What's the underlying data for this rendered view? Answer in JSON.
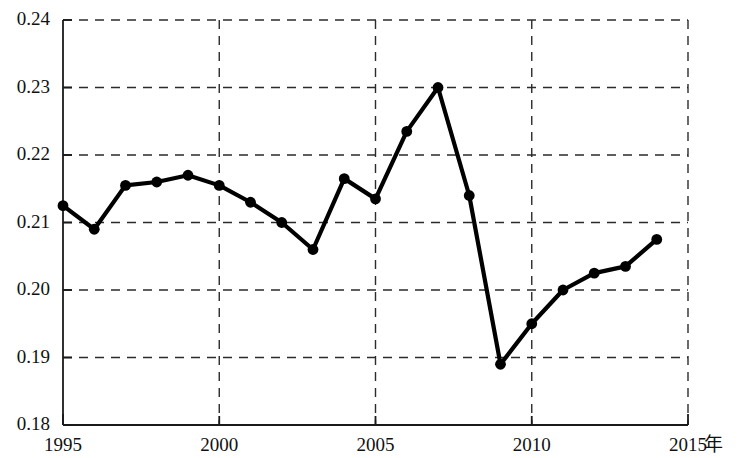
{
  "chart_data": {
    "type": "line",
    "title": "",
    "subtitle": "",
    "xlabel": "年",
    "ylabel": "",
    "xlim": [
      1995,
      2015
    ],
    "ylim": [
      0.18,
      0.24
    ],
    "grid": true,
    "legend": null,
    "x_tick_labels": [
      "1995",
      "2000",
      "2005",
      "2010",
      "2015"
    ],
    "x_ticks": [
      1995,
      2000,
      2005,
      2010,
      2015
    ],
    "y_tick_labels": [
      "0.18",
      "0.19",
      "0.20",
      "0.21",
      "0.22",
      "0.23",
      "0.24"
    ],
    "y_ticks": [
      0.18,
      0.19,
      0.2,
      0.21,
      0.22,
      0.23,
      0.24
    ],
    "x": [
      1995,
      1996,
      1997,
      1998,
      1999,
      2000,
      2001,
      2002,
      2003,
      2004,
      2005,
      2006,
      2007,
      2008,
      2009,
      2010,
      2011,
      2012,
      2013,
      2014
    ],
    "values": [
      0.2125,
      0.209,
      0.2155,
      0.216,
      0.217,
      0.2155,
      0.213,
      0.21,
      0.206,
      0.2165,
      0.2135,
      0.2235,
      0.23,
      0.214,
      0.189,
      0.195,
      0.2,
      0.2025,
      0.2035,
      0.2075
    ],
    "marker": "filled-circle",
    "line_color": "#000000",
    "marker_color": "#000000",
    "grid_color": "#2b2b2b",
    "axis_color": "#1a1a1a",
    "background_color": "#ffffff"
  },
  "axis": {
    "x_unit_label": "年"
  }
}
